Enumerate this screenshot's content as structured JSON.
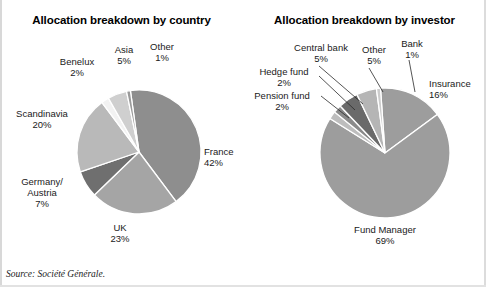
{
  "source_note": "Source: Société Générale.",
  "charts": [
    {
      "id": "country",
      "title": "Allocation breakdown by country",
      "chart_data": {
        "type": "pie",
        "title": "Allocation breakdown by country",
        "xlabel": "",
        "ylabel": "",
        "unit": "%",
        "legend": "labels-outside",
        "start_angle_deg": -8,
        "direction": "clockwise",
        "categories": [
          "France",
          "UK",
          "Germany/ Austria",
          "Scandinavia",
          "Benelux",
          "Asia",
          "Other"
        ],
        "values": [
          42,
          23,
          7,
          20,
          2,
          5,
          1
        ],
        "colors": [
          "#8e8e8e",
          "#a5a5a5",
          "#6f6f6f",
          "#b9b9b9",
          "#f2f2f2",
          "#cfcfcf",
          "#9a9a9a"
        ],
        "slices": [
          {
            "label": "France",
            "value": 42,
            "display": "42%",
            "color": "#8e8e8e"
          },
          {
            "label": "UK",
            "value": 23,
            "display": "23%",
            "color": "#a5a5a5"
          },
          {
            "label": "Germany/ Austria",
            "value": 7,
            "display": "7%",
            "color": "#6f6f6f"
          },
          {
            "label": "Scandinavia",
            "value": 20,
            "display": "20%",
            "color": "#b9b9b9"
          },
          {
            "label": "Benelux",
            "value": 2,
            "display": "2%",
            "color": "#f2f2f2"
          },
          {
            "label": "Asia",
            "value": 5,
            "display": "5%",
            "color": "#cfcfcf"
          },
          {
            "label": "Other",
            "value": 1,
            "display": "1%",
            "color": "#9a9a9a"
          }
        ]
      },
      "labels": [
        {
          "name": "slice-label-benelux",
          "line1": "Benelux",
          "line2": "2%"
        },
        {
          "name": "slice-label-asia",
          "line1": "Asia",
          "line2": "5%"
        },
        {
          "name": "slice-label-other",
          "line1": "Other",
          "line2": "1%"
        },
        {
          "name": "slice-label-scandinavia",
          "line1": "Scandinavia",
          "line2": "20%"
        },
        {
          "name": "slice-label-germany",
          "line1": "Germany/",
          "line1b": "Austria",
          "line2": "7%"
        },
        {
          "name": "slice-label-uk",
          "line1": "UK",
          "line2": "23%"
        },
        {
          "name": "slice-label-france",
          "line1": "France",
          "line2": "42%"
        }
      ]
    },
    {
      "id": "investor",
      "title": "Allocation breakdown by investor",
      "chart_data": {
        "type": "pie",
        "title": "Allocation breakdown by investor",
        "xlabel": "",
        "ylabel": "",
        "unit": "%",
        "legend": "labels-outside-with-leader-lines",
        "start_angle_deg": -4,
        "direction": "clockwise",
        "categories": [
          "Insurance",
          "Fund Manager",
          "Pension fund",
          "Hedge fund",
          "Central bank",
          "Other",
          "Bank"
        ],
        "values": [
          16,
          69,
          2,
          2,
          5,
          5,
          1
        ],
        "colors": [
          "#9d9d9d",
          "#9d9d9d",
          "#bdbdbd",
          "#8a8a8a",
          "#6a6a6a",
          "#b5b5b5",
          "#cccccc"
        ],
        "slices": [
          {
            "label": "Insurance",
            "value": 16,
            "display": "16%",
            "color": "#9d9d9d"
          },
          {
            "label": "Fund Manager",
            "value": 69,
            "display": "69%",
            "color": "#9d9d9d"
          },
          {
            "label": "Pension fund",
            "value": 2,
            "display": "2%",
            "color": "#bdbdbd"
          },
          {
            "label": "Hedge fund",
            "value": 2,
            "display": "2%",
            "color": "#8a8a8a"
          },
          {
            "label": "Central bank",
            "value": 5,
            "display": "5%",
            "color": "#6a6a6a"
          },
          {
            "label": "Other",
            "value": 5,
            "display": "5%",
            "color": "#b5b5b5"
          },
          {
            "label": "Bank",
            "value": 1,
            "display": "1%",
            "color": "#cccccc"
          }
        ]
      },
      "labels": [
        {
          "name": "slice-label-central-bank",
          "line1": "Central bank",
          "line2": "5%"
        },
        {
          "name": "slice-label-other",
          "line1": "Other",
          "line2": "5%"
        },
        {
          "name": "slice-label-bank",
          "line1": "Bank",
          "line2": "1%"
        },
        {
          "name": "slice-label-hedge-fund",
          "line1": "Hedge fund",
          "line2": "2%"
        },
        {
          "name": "slice-label-pension-fund",
          "line1": "Pension fund",
          "line2": "2%"
        },
        {
          "name": "slice-label-insurance",
          "line1": "Insurance",
          "line2": "16%"
        },
        {
          "name": "slice-label-fund-manager",
          "line1": "Fund Manager",
          "line2": "69%"
        }
      ]
    }
  ]
}
